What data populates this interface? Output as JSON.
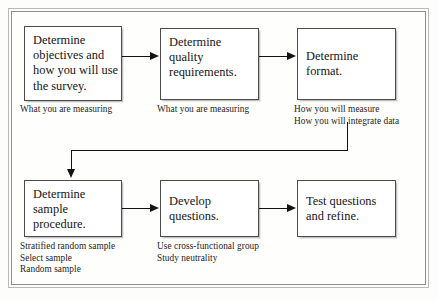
{
  "diagram": {
    "nodes": [
      {
        "id": "objectives",
        "label": "Determine\nobjectives and\nhow you will use\nthe survey."
      },
      {
        "id": "quality",
        "label": "Determine\nquality\nrequirements."
      },
      {
        "id": "format",
        "label": "Determine\nformat."
      },
      {
        "id": "sample-procedure",
        "label": "Determine\nsample\nprocedure."
      },
      {
        "id": "develop",
        "label": "Develop\nquestions."
      },
      {
        "id": "test",
        "label": "Test questions\nand refine."
      }
    ],
    "captions": [
      {
        "id": "caption-objectives",
        "text": "What you are measuring"
      },
      {
        "id": "caption-quality",
        "text": "What you are measuring"
      },
      {
        "id": "caption-format",
        "text": "How you will measure\nHow you will integrate data"
      },
      {
        "id": "caption-sample",
        "text": "Stratified random sample\nSelect sample\nRandom sample"
      },
      {
        "id": "caption-develop",
        "text": "Use cross-functional group\nStudy neutrality"
      }
    ],
    "connectors": [
      {
        "id": "objectives-to-quality",
        "type": "arrow-right"
      },
      {
        "id": "quality-to-format",
        "type": "arrow-right"
      },
      {
        "id": "format-to-sample",
        "type": "elbow-down-left-down"
      },
      {
        "id": "sample-to-develop",
        "type": "arrow-right"
      },
      {
        "id": "develop-to-test",
        "type": "arrow-right"
      }
    ],
    "colors": {
      "node_border": "#4c4c4c",
      "node_fill": "#ffffff",
      "connector": "#131313",
      "frame_border": "#8e8e8a",
      "page_background": "#fdfdfc",
      "text": "#151515"
    }
  }
}
